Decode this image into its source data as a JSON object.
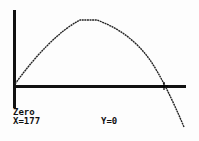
{
  "calculator": {
    "mode_label": "Zero",
    "x_readout": "X=177",
    "y_readout": "Y=0"
  },
  "graph": {
    "function_type": "parabola (downward)",
    "axis_color": "#111111",
    "curve_color": "#222222",
    "cursor_icon": "plus-cursor"
  }
}
